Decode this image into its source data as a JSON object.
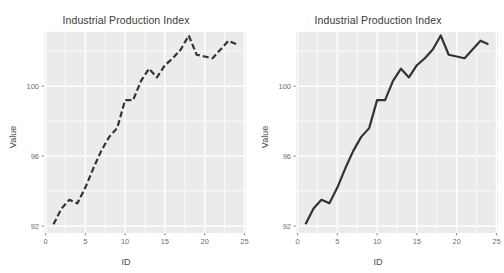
{
  "figure": {
    "width": 504,
    "height": 273,
    "background": "#ffffff",
    "panel_background": "#ebebeb",
    "gridline_color": "#ffffff",
    "line_color": "#333333",
    "text_color": "#4a4a4a",
    "tick_label_color": "#6e6e6e"
  },
  "panels": [
    {
      "id": "left-panel",
      "title": "Industrial Production Index",
      "xlabel": "ID",
      "ylabel": "Value",
      "linetype": "dashed"
    },
    {
      "id": "right-panel",
      "title": "Industrial Production Index",
      "xlabel": "ID",
      "ylabel": "Value",
      "linetype": "solid"
    }
  ],
  "chart_data": [
    {
      "type": "line",
      "title": "Industrial Production Index",
      "xlabel": "ID",
      "ylabel": "Value",
      "linestyle": "dashed",
      "linecolor": "#333333",
      "grid": true,
      "legend": "none",
      "xlim": [
        -0.2,
        25.2
      ],
      "ylim": [
        91.6,
        103.1
      ],
      "xticks": [
        0,
        5,
        10,
        15,
        20,
        25
      ],
      "yticks": [
        92,
        96,
        100
      ],
      "x": [
        1,
        2,
        3,
        4,
        5,
        6,
        7,
        8,
        9,
        10,
        11,
        12,
        13,
        14,
        15,
        16,
        17,
        18,
        19,
        20,
        21,
        22,
        23,
        24
      ],
      "y": [
        92.1,
        93.0,
        93.5,
        93.3,
        94.2,
        95.3,
        96.3,
        97.1,
        97.6,
        99.2,
        99.2,
        100.3,
        101.0,
        100.5,
        101.2,
        101.6,
        102.1,
        102.9,
        101.8,
        101.7,
        101.6,
        102.1,
        102.6,
        102.4
      ]
    },
    {
      "type": "line",
      "title": "Industrial Production Index",
      "xlabel": "ID",
      "ylabel": "Value",
      "linestyle": "solid",
      "linecolor": "#333333",
      "grid": true,
      "legend": "none",
      "xlim": [
        -0.2,
        25.2
      ],
      "ylim": [
        91.6,
        103.1
      ],
      "xticks": [
        0,
        5,
        10,
        15,
        20,
        25
      ],
      "yticks": [
        92,
        96,
        100
      ],
      "x": [
        1,
        2,
        3,
        4,
        5,
        6,
        7,
        8,
        9,
        10,
        11,
        12,
        13,
        14,
        15,
        16,
        17,
        18,
        19,
        20,
        21,
        22,
        23,
        24
      ],
      "y": [
        92.1,
        93.0,
        93.5,
        93.3,
        94.2,
        95.3,
        96.3,
        97.1,
        97.6,
        99.2,
        99.2,
        100.3,
        101.0,
        100.5,
        101.2,
        101.6,
        102.1,
        102.9,
        101.8,
        101.7,
        101.6,
        102.1,
        102.6,
        102.4
      ]
    }
  ]
}
